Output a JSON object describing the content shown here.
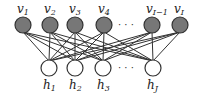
{
  "diagram": {
    "type": "bipartite-network",
    "visible_layer": {
      "fill": "#777777",
      "stroke": "#333333",
      "nodes": [
        {
          "id": "v1",
          "base": "v",
          "sub": "1",
          "x": 23,
          "y": 25
        },
        {
          "id": "v2",
          "base": "v",
          "sub": "2",
          "x": 50,
          "y": 25
        },
        {
          "id": "v3",
          "base": "v",
          "sub": "3",
          "x": 75,
          "y": 25
        },
        {
          "id": "v4",
          "base": "v",
          "sub": "4",
          "x": 104,
          "y": 25
        },
        {
          "id": "vI-1",
          "base": "v",
          "sub": "I−1",
          "x": 152,
          "y": 25
        },
        {
          "id": "vI",
          "base": "v",
          "sub": "I",
          "x": 180,
          "y": 25
        }
      ],
      "ellipsis": "· · ·"
    },
    "hidden_layer": {
      "fill": "#ffffff",
      "stroke": "#333333",
      "nodes": [
        {
          "id": "h1",
          "base": "h",
          "sub": "1",
          "x": 49,
          "y": 68
        },
        {
          "id": "h2",
          "base": "h",
          "sub": "2",
          "x": 75,
          "y": 68
        },
        {
          "id": "h3",
          "base": "h",
          "sub": "3",
          "x": 103,
          "y": 68
        },
        {
          "id": "hJ",
          "base": "h",
          "sub": "J",
          "x": 153,
          "y": 68
        }
      ],
      "ellipsis": "· · ·"
    },
    "connectivity": "fully-connected",
    "edge_color": "#333333",
    "node_radius": 8
  }
}
